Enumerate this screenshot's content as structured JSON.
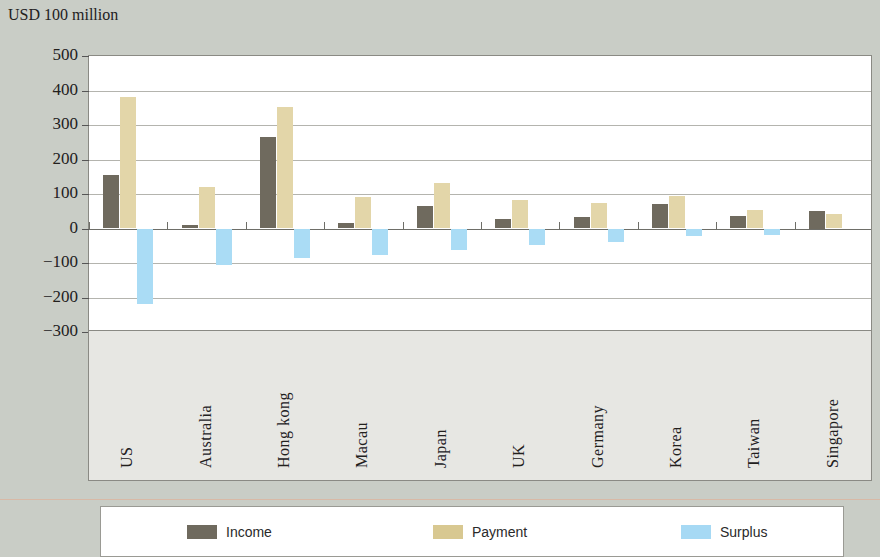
{
  "axis_title": "USD 100 million",
  "legend": {
    "items": [
      {
        "key": "income",
        "label": "Income",
        "color": "#6f6a5e"
      },
      {
        "key": "payment",
        "label": "Payment",
        "color": "#d8c891"
      },
      {
        "key": "surplus",
        "label": "Surplus",
        "color": "#a6d9f4"
      }
    ]
  },
  "chart_data": {
    "type": "bar",
    "title": "",
    "subtitle": "",
    "xlabel": "",
    "ylabel": "USD 100 million",
    "ylim": [
      -300,
      500
    ],
    "ytick_step": 100,
    "ytick_labels": [
      "500",
      "400",
      "300",
      "200",
      "100",
      "0",
      "−100",
      "−200",
      "−300"
    ],
    "ytick_values": [
      500,
      400,
      300,
      200,
      100,
      0,
      -100,
      -200,
      -300
    ],
    "grid": true,
    "legend_position": "bottom",
    "categories": [
      "US",
      "Australia",
      "Hong kong",
      "Macau",
      "Japan",
      "UK",
      "Germany",
      "Korea",
      "Taiwan",
      "Singapore"
    ],
    "series": [
      {
        "name": "Income",
        "color": "#6f6a5e",
        "values": [
          155,
          10,
          265,
          15,
          65,
          28,
          32,
          70,
          35,
          50
        ]
      },
      {
        "name": "Payment",
        "color": "#e3d6a9",
        "values": [
          380,
          120,
          352,
          92,
          132,
          82,
          73,
          93,
          55,
          43
        ]
      },
      {
        "name": "Surplus",
        "color": "#aadcf5",
        "values": [
          -220,
          -105,
          -85,
          -78,
          -62,
          -48,
          -38,
          -22,
          -18,
          0
        ]
      }
    ]
  }
}
